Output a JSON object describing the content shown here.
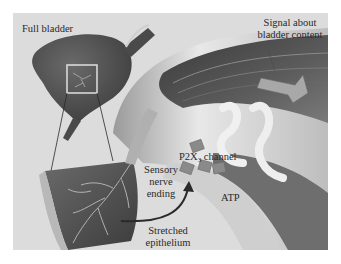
{
  "figure": {
    "labels": {
      "full_bladder": "Full bladder",
      "signal_line1": "Signal about",
      "signal_line2": "bladder content",
      "p2x3_prefix": "P2X",
      "p2x3_sub": "3",
      "p2x3_suffix": " channel",
      "sensory_line1": "Sensory",
      "sensory_line2": "nerve",
      "sensory_line3": "ending",
      "atp": "ATP",
      "stretched_line1": "Stretched",
      "stretched_line2": "epithelium"
    },
    "colors": {
      "background": "#dcdcdc",
      "bladder": "#5a5a5a",
      "nerve_dark": "#4a4a4a",
      "nerve_light": "#e6e6e6",
      "text": "#2a2a2a"
    }
  }
}
